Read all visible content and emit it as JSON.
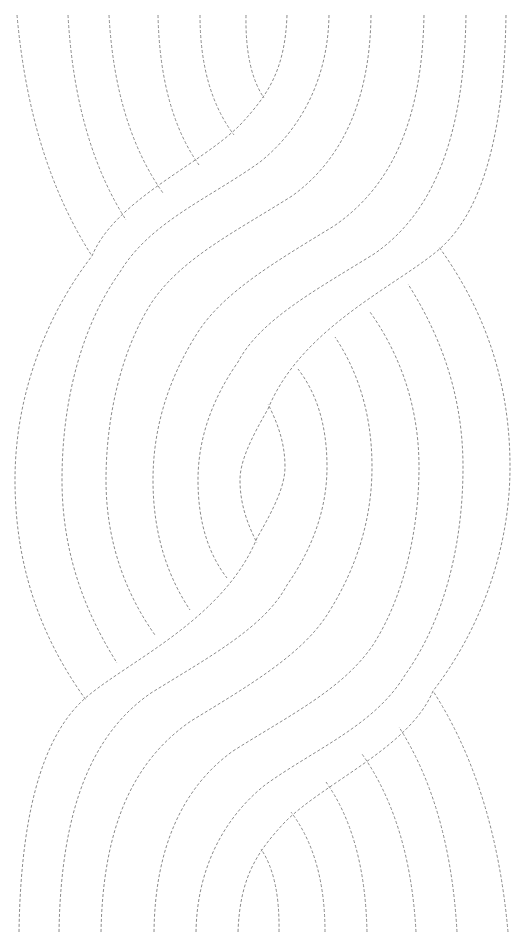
{
  "worksheet": {
    "type": "dashed-line tracing pattern",
    "description": "Two interwoven S-shaped braided bands of concentric dashed lines with a lens shape at center",
    "colors": {
      "background": "#ffffff",
      "line": "#8a8a8a"
    },
    "line_style": {
      "dash": "3 2",
      "width": 1
    },
    "symmetry": "180-degree rotation about (262.5, 473.5)",
    "upper_half": {
      "short_arcs": [
        "M17,15 Q30,160 92,256",
        "M68,15 Q75,140 126,220",
        "M109,15 Q115,125 163,193",
        "M158,15 Q160,110 199,165",
        "M200,15 Q200,90 234,135",
        "M246,15 Q245,70 264,98"
      ],
      "s_lines": [
        "M287,15 C285,70 268,95 240,125 C200,165 115,200 92,256 C50,310 15,390 15,480 C15,580 50,650 86,700",
        "M329,15 C328,80 300,130 260,162 C210,198 150,222 120,272 C82,325 62,400 62,480 C62,560 90,620 117,663",
        "M371,15 C370,100 342,160 292,196 C235,232 182,258 152,302 C120,352 106,420 106,480 C106,548 130,600 155,635",
        "M424,15 C422,120 392,186 334,226 C275,262 224,292 198,332 C166,382 153,432 153,480 C153,538 170,580 190,610",
        "M466,15 C464,140 432,214 374,254 C316,290 260,320 238,362 C210,402 198,442 198,480 C198,525 210,556 227,578",
        "M506,15 C504,150 476,220 436,252 C392,288 300,330 268,409 C250,440 240,462 240,480 C240,505 248,525 257,543"
      ]
    }
  }
}
